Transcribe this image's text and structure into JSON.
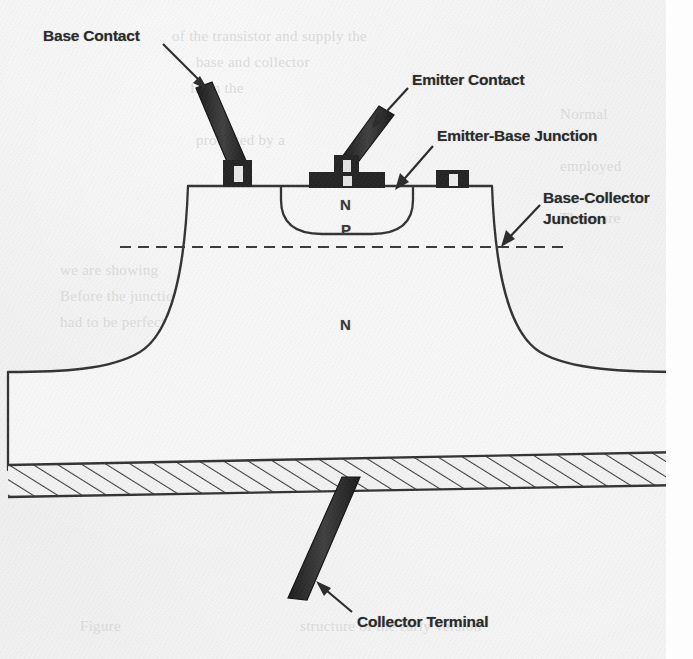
{
  "figure": {
    "kind": "cross-section-diagram",
    "background_color": "#f0f0f0",
    "ink_color": "#2b2b2b"
  },
  "callouts": [
    {
      "id": "base-contact",
      "text": "Base Contact"
    },
    {
      "id": "emitter-contact",
      "text": "Emitter Contact"
    },
    {
      "id": "eb-junction",
      "text": "Emitter-Base Junction"
    },
    {
      "id": "bc-junction",
      "text": "Base-Collector Junction"
    },
    {
      "id": "collector-terminal",
      "text": "Collector Terminal"
    }
  ],
  "labels": {
    "base_contact": "Base Contact",
    "emitter_contact": "Emitter Contact",
    "emitter_base_junction": "Emitter-Base Junction",
    "base_collector_junction": "Base-Collector Junction",
    "collector_terminal": "Collector Terminal"
  },
  "regions": [
    {
      "id": "emitter",
      "symbol": "N",
      "role": "emitter region (N-type)"
    },
    {
      "id": "base",
      "symbol": "P",
      "role": "base region (P-type)"
    },
    {
      "id": "collector",
      "symbol": "N",
      "role": "collector body (N-type)"
    }
  ],
  "region_symbols": {
    "emitter": "N",
    "base": "P",
    "collector": "N"
  },
  "ghost_text": {
    "line1": "of the transistor and supply the",
    "line2": "base and collector",
    "line3": "from the",
    "line4": "Normal",
    "line5": "protected by a",
    "line6": "employed",
    "line7": "These are",
    "line8": "we are showing",
    "line9": "Before the junction transistor could",
    "line10": "had to be perfected",
    "line11": "Emitter",
    "line12": "Figure",
    "line13": "structure of the early version"
  }
}
